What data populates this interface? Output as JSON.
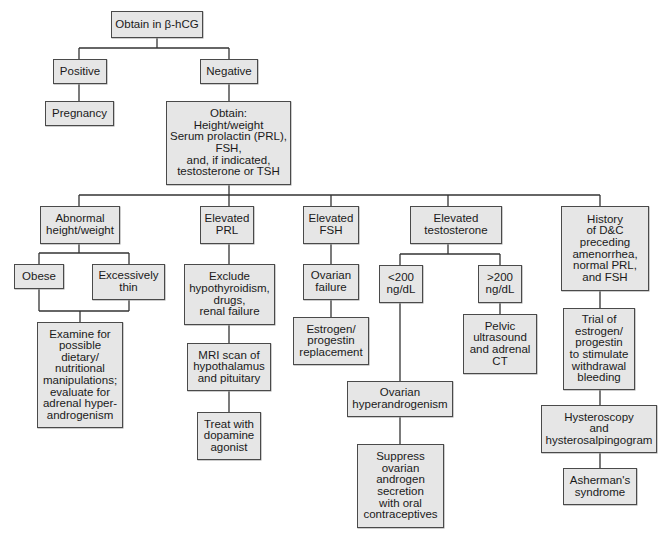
{
  "diagram": {
    "type": "flowchart",
    "nodes": {
      "obtain_hcg": "Obtain in β-hCG",
      "positive": "Positive",
      "negative": "Negative",
      "pregnancy": "Pregnancy",
      "obtain_tests": "Obtain:\nHeight/weight\nSerum prolactin (PRL),\nFSH,\nand, if indicated,\ntestosterone or TSH",
      "abnormal_hw": "Abnormal\nheight/weight",
      "elevated_prl": "Elevated\nPRL",
      "elevated_fsh": "Elevated\nFSH",
      "elevated_testosterone": "Elevated\ntestosterone",
      "history_dc": "History\nof D&C\npreceding\namenorrhea,\nnormal PRL,\nand FSH",
      "obese": "Obese",
      "excessively_thin": "Excessively\nthin",
      "examine_dietary": "Examine for\npossible\ndietary/\nnutritional\nmanipulations;\nevaluate for\nadrenal hyper-\nandrogenism",
      "exclude_hypo": "Exclude\nhypothyroidism,\ndrugs,\nrenal failure",
      "mri_scan": "MRI scan of\nhypothalamus\nand pituitary",
      "dopamine": "Treat with\ndopamine\nagonist",
      "ovarian_failure": "Ovarian\nfailure",
      "estrogen_replacement": "Estrogen/\nprogestin\nreplacement",
      "lt200": "<200\nng/dL",
      "gt200": ">200\nng/dL",
      "pelvic_us": "Pelvic\nultrasound\nand adrenal\nCT",
      "ovarian_hyper": "Ovarian\nhyperandrogenism",
      "suppress": "Suppress\novarian\nandrogen\nsecretion\nwith oral\ncontraceptives",
      "trial_estrogen": "Trial of\nestrogen/\nprogestin\nto stimulate\nwithdrawal\nbleeding",
      "hysteroscopy": "Hysteroscopy\nand\nhysterosalpingogram",
      "asherman": "Asherman's\nsyndrome"
    },
    "edges": [
      [
        "obtain_hcg",
        "positive"
      ],
      [
        "obtain_hcg",
        "negative"
      ],
      [
        "positive",
        "pregnancy"
      ],
      [
        "negative",
        "obtain_tests"
      ],
      [
        "obtain_tests",
        "abnormal_hw"
      ],
      [
        "obtain_tests",
        "elevated_prl"
      ],
      [
        "obtain_tests",
        "elevated_fsh"
      ],
      [
        "obtain_tests",
        "elevated_testosterone"
      ],
      [
        "obtain_tests",
        "history_dc"
      ],
      [
        "abnormal_hw",
        "obese"
      ],
      [
        "abnormal_hw",
        "excessively_thin"
      ],
      [
        "obese",
        "examine_dietary"
      ],
      [
        "excessively_thin",
        "examine_dietary"
      ],
      [
        "elevated_prl",
        "exclude_hypo"
      ],
      [
        "exclude_hypo",
        "mri_scan"
      ],
      [
        "mri_scan",
        "dopamine"
      ],
      [
        "elevated_fsh",
        "ovarian_failure"
      ],
      [
        "ovarian_failure",
        "estrogen_replacement"
      ],
      [
        "elevated_testosterone",
        "lt200"
      ],
      [
        "elevated_testosterone",
        "gt200"
      ],
      [
        "lt200",
        "ovarian_hyper"
      ],
      [
        "ovarian_hyper",
        "suppress"
      ],
      [
        "gt200",
        "pelvic_us"
      ],
      [
        "history_dc",
        "trial_estrogen"
      ],
      [
        "trial_estrogen",
        "hysteroscopy"
      ],
      [
        "hysteroscopy",
        "asherman"
      ]
    ],
    "colors": {
      "box_fill": "#e6e6e6",
      "box_border": "#4a4a4a",
      "line": "#333333",
      "background": "#ffffff"
    }
  }
}
